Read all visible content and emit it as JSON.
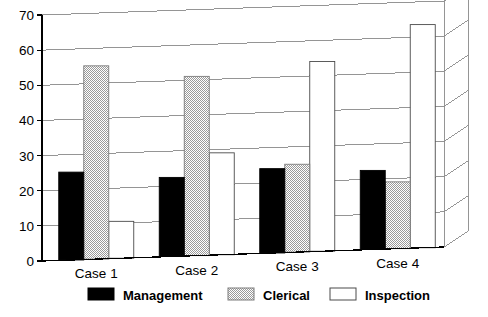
{
  "chart_data": {
    "type": "bar",
    "title": "",
    "xlabel": "",
    "ylabel": "",
    "categories": [
      "Case 1",
      "Case 2",
      "Case 3",
      "Case 4"
    ],
    "series": [
      {
        "name": "Management",
        "values": [
          25,
          22.5,
          24,
          22.5
        ],
        "color": "#000000",
        "pattern": "solid-black"
      },
      {
        "name": "Clerical",
        "values": [
          55,
          51,
          25,
          19
        ],
        "color": "#c8c8c8",
        "pattern": "fine-checker-gray"
      },
      {
        "name": "Inspection",
        "values": [
          10.5,
          29,
          54,
          63.5
        ],
        "color": "#ffffff",
        "pattern": "white-outline"
      }
    ],
    "ylim": [
      0,
      70
    ],
    "yticks": [
      0,
      10,
      20,
      30,
      40,
      50,
      60,
      70
    ],
    "ytick_labels": [
      "0",
      "10",
      "20",
      "30",
      "40",
      "50",
      "60",
      "70"
    ],
    "grid": true,
    "grid_axis": "y",
    "legend_position": "bottom",
    "style_note": "slight 3d perspective, gridlines slope up to the right"
  },
  "legend": {
    "entries": [
      {
        "label": "Management",
        "swatch": "solid-black"
      },
      {
        "label": "Clerical",
        "swatch": "fine-checker-gray"
      },
      {
        "label": "Inspection",
        "swatch": "white-outline"
      }
    ]
  },
  "colors": {
    "axis": "#000000",
    "grid": "#8a8a8a",
    "management": "#000000",
    "clerical": "#c8c8c8",
    "inspection": "#ffffff",
    "background": "#ffffff"
  }
}
